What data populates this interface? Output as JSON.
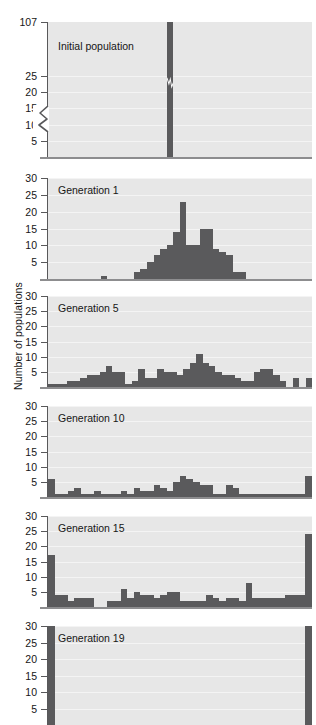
{
  "figure": {
    "ylabel": "Number of populations",
    "bar_color": "#5a5a5c",
    "panel_bg": "#e7e7e7",
    "axis_color": "#58585a"
  },
  "chart_data": {
    "type": "bar",
    "xlabel": "",
    "ylabel": "Number of populations",
    "layout": "6 stacked histogram panels sharing one y-axis caption",
    "grid": true,
    "legend": "none",
    "panels": [
      {
        "label": "Initial population",
        "ylim": [
          0,
          107
        ],
        "yticks": [
          5,
          10,
          15,
          20,
          25,
          107
        ],
        "ytick_labels": [
          "5",
          "10",
          "15",
          "20",
          "25",
          "107"
        ],
        "axis_break": true,
        "axis_break_between": [
          25,
          107
        ],
        "bar_break_marker": true,
        "n_bins": 40,
        "values": [
          0,
          0,
          0,
          0,
          0,
          0,
          0,
          0,
          0,
          0,
          0,
          0,
          0,
          0,
          0,
          0,
          0,
          0,
          107,
          0,
          0,
          0,
          0,
          0,
          0,
          0,
          0,
          0,
          0,
          0,
          0,
          0,
          0,
          0,
          0,
          0,
          0,
          0,
          0,
          0
        ]
      },
      {
        "label": "Generation 1",
        "ylim": [
          0,
          30
        ],
        "yticks": [
          5,
          10,
          15,
          20,
          25,
          30
        ],
        "ytick_labels": [
          "5",
          "10",
          "15",
          "20",
          "25",
          "30"
        ],
        "axis_break": false,
        "n_bins": 40,
        "values": [
          0,
          0,
          0,
          0,
          0,
          0,
          0,
          0,
          1,
          0,
          0,
          0,
          0,
          2,
          3,
          5,
          7,
          9,
          10,
          14,
          23,
          10,
          10,
          15,
          15,
          9,
          8,
          7,
          2,
          2,
          0,
          0,
          0,
          0,
          0,
          0,
          0,
          0,
          0,
          0
        ]
      },
      {
        "label": "Generation 5",
        "ylim": [
          0,
          30
        ],
        "yticks": [
          5,
          10,
          15,
          20,
          25,
          30
        ],
        "ytick_labels": [
          "5",
          "10",
          "15",
          "20",
          "25",
          "30"
        ],
        "axis_break": false,
        "n_bins": 40,
        "values": [
          1,
          1,
          1,
          2,
          2,
          3,
          4,
          4,
          5,
          7,
          5,
          5,
          1,
          2,
          6,
          3,
          3,
          6,
          5,
          5,
          4,
          6,
          8,
          11,
          8,
          7,
          5,
          4,
          4,
          3,
          2,
          2,
          5,
          6,
          6,
          4,
          2,
          0,
          3,
          0,
          3
        ]
      },
      {
        "label": "Generation 10",
        "ylim": [
          0,
          30
        ],
        "yticks": [
          5,
          10,
          15,
          20,
          25,
          30
        ],
        "ytick_labels": [
          "5",
          "10",
          "15",
          "20",
          "25",
          "30"
        ],
        "axis_break": false,
        "n_bins": 40,
        "values": [
          6,
          1,
          1,
          2,
          3,
          1,
          1,
          2,
          1,
          1,
          1,
          2,
          1,
          3,
          2,
          2,
          4,
          3,
          2,
          5,
          7,
          6,
          5,
          4,
          4,
          1,
          1,
          4,
          3,
          1,
          1,
          1,
          1,
          1,
          1,
          1,
          1,
          1,
          1,
          7
        ]
      },
      {
        "label": "Generation 15",
        "ylim": [
          0,
          30
        ],
        "yticks": [
          5,
          10,
          15,
          20,
          25,
          30
        ],
        "ytick_labels": [
          "5",
          "10",
          "15",
          "20",
          "25",
          "30"
        ],
        "axis_break": false,
        "n_bins": 40,
        "values": [
          17,
          4,
          4,
          2,
          3,
          3,
          3,
          0,
          0,
          2,
          2,
          6,
          3,
          5,
          4,
          4,
          3,
          4,
          5,
          5,
          2,
          2,
          2,
          2,
          4,
          3,
          2,
          3,
          3,
          2,
          8,
          3,
          3,
          3,
          3,
          3,
          4,
          4,
          4,
          24
        ]
      },
      {
        "label": "Generation 19",
        "ylim": [
          0,
          30
        ],
        "yticks": [
          5,
          10,
          15,
          20,
          25,
          30
        ],
        "ytick_labels": [
          "5",
          "10",
          "15",
          "20",
          "25",
          "30"
        ],
        "axis_break": false,
        "clipped_bottom": true,
        "n_bins": 40,
        "values": [
          30,
          0,
          0,
          0,
          0,
          0,
          0,
          0,
          0,
          0,
          0,
          0,
          0,
          0,
          0,
          0,
          0,
          0,
          0,
          0,
          0,
          0,
          0,
          0,
          0,
          0,
          0,
          0,
          0,
          0,
          0,
          0,
          0,
          0,
          0,
          0,
          0,
          0,
          0,
          30
        ]
      }
    ]
  }
}
